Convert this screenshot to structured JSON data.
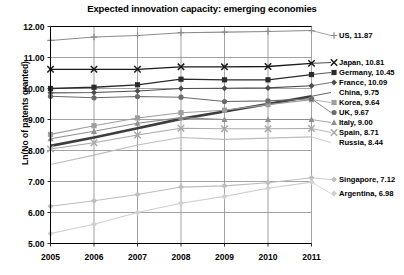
{
  "chart_data": {
    "type": "line",
    "title": "Expected innovation capacity: emerging economies",
    "xlabel": "",
    "ylabel": "Ln(No of patents granted)",
    "x": [
      2005,
      2006,
      2007,
      2008,
      2009,
      2010,
      2011
    ],
    "xticklabels": [
      "2005",
      "2006",
      "2007",
      "2008",
      "2009",
      "2010",
      "2011"
    ],
    "yticklabels": [
      "5.00",
      "6.00",
      "7.00",
      "8.00",
      "9.00",
      "10.00",
      "11.00",
      "12.00"
    ],
    "yticks": [
      5,
      6,
      7,
      8,
      9,
      10,
      11,
      12
    ],
    "ylim": [
      5.0,
      12.0
    ],
    "grid": true,
    "legend_position": "right-inline-labels",
    "series": [
      {
        "name": "US",
        "end_value": 11.87,
        "label": "US, 11.87",
        "color": "#8c8c8c",
        "marker": "plus",
        "width": 1.1,
        "values": [
          11.55,
          11.66,
          11.71,
          11.8,
          11.82,
          11.84,
          11.87
        ]
      },
      {
        "name": "Japan",
        "end_value": 10.81,
        "label": "Japan, 10.81",
        "color": "#1a1a1a",
        "marker": "x",
        "width": 1.3,
        "values": [
          10.62,
          10.62,
          10.62,
          10.7,
          10.7,
          10.71,
          10.81
        ]
      },
      {
        "name": "Germany",
        "end_value": 10.45,
        "label": "Germany, 10.45",
        "color": "#2b2b2b",
        "marker": "square",
        "width": 1.3,
        "values": [
          10.0,
          10.04,
          10.12,
          10.3,
          10.28,
          10.28,
          10.45
        ]
      },
      {
        "name": "France",
        "end_value": 10.09,
        "label": "France, 10.09",
        "color": "#4d4d4d",
        "marker": "diamond",
        "width": 1.1,
        "values": [
          9.86,
          9.87,
          9.92,
          10.0,
          10.01,
          10.02,
          10.09
        ]
      },
      {
        "name": "China",
        "end_value": 9.75,
        "label": "China, 9.75",
        "color": "#3d3d3d",
        "marker": "none",
        "width": 2.6,
        "values": [
          8.15,
          8.42,
          8.72,
          9.02,
          9.26,
          9.5,
          9.75
        ]
      },
      {
        "name": "Korea",
        "end_value": 9.64,
        "label": "Korea, 9.64",
        "color": "#9e9e9e",
        "marker": "square",
        "width": 1.1,
        "values": [
          8.52,
          8.8,
          9.05,
          9.22,
          9.3,
          9.48,
          9.64
        ]
      },
      {
        "name": "UK",
        "end_value": 9.67,
        "label": "UK, 9.67",
        "color": "#6b6b6b",
        "marker": "circle",
        "width": 1.1,
        "values": [
          9.75,
          9.7,
          9.74,
          9.72,
          9.58,
          9.6,
          9.67
        ]
      },
      {
        "name": "Italy",
        "end_value": 9.0,
        "label": "Italy, 9.00",
        "color": "#8f8f8f",
        "marker": "triangle",
        "width": 1.1,
        "values": [
          8.38,
          8.62,
          8.88,
          9.06,
          9.0,
          9.0,
          9.0
        ]
      },
      {
        "name": "Spain",
        "end_value": 8.71,
        "label": "Spain, 8.71",
        "color": "#a8a8a8",
        "marker": "x",
        "width": 1.1,
        "values": [
          8.05,
          8.25,
          8.5,
          8.72,
          8.7,
          8.7,
          8.71
        ]
      },
      {
        "name": "Russia",
        "end_value": 8.44,
        "label": "Russia, 8.44",
        "color": "#bdbdbd",
        "marker": "none",
        "width": 1.1,
        "values": [
          7.55,
          7.85,
          8.18,
          8.42,
          8.36,
          8.4,
          8.44
        ]
      },
      {
        "name": "Singapore",
        "end_value": 7.12,
        "label": "Singapore, 7.12",
        "color": "#bdbdbd",
        "marker": "diamond",
        "width": 1.1,
        "values": [
          6.2,
          6.38,
          6.58,
          6.82,
          6.86,
          6.96,
          7.12
        ]
      },
      {
        "name": "Argentina",
        "end_value": 6.98,
        "label": "Argentina, 6.98",
        "color": "#cfcfcf",
        "marker": "diamond",
        "width": 1.1,
        "values": [
          5.32,
          5.62,
          6.0,
          6.3,
          6.52,
          6.78,
          6.98
        ]
      }
    ],
    "label_positions": [
      {
        "name": "US",
        "y": 38
      },
      {
        "name": "Japan",
        "y": 65
      },
      {
        "name": "Germany",
        "y": 75
      },
      {
        "name": "France",
        "y": 85
      },
      {
        "name": "China",
        "y": 95
      },
      {
        "name": "Korea",
        "y": 105
      },
      {
        "name": "UK",
        "y": 115
      },
      {
        "name": "Italy",
        "y": 125
      },
      {
        "name": "Spain",
        "y": 135
      },
      {
        "name": "Russia",
        "y": 145
      },
      {
        "name": "Singapore",
        "y": 182
      },
      {
        "name": "Argentina",
        "y": 196
      }
    ]
  }
}
